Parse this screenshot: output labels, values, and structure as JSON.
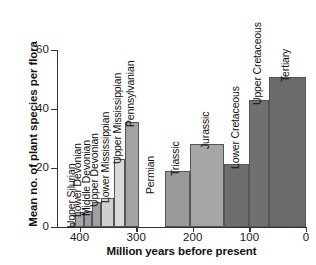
{
  "chart_data": {
    "type": "bar",
    "title": "",
    "xlabel": "Million years before present",
    "ylabel": "Mean no. of plant species per flora",
    "xlim": [
      440,
      0
    ],
    "ylim": [
      0,
      60
    ],
    "x_ticks": [
      400,
      300,
      200,
      100,
      0
    ],
    "x_tick_labels": [
      "400",
      "300",
      "200",
      "100",
      "0"
    ],
    "y_ticks": [
      0,
      20,
      40,
      60
    ],
    "y_tick_labels": [
      "0",
      "20",
      "40",
      "60"
    ],
    "grid": false,
    "legend": "none",
    "axis_direction": "x-axis reversed: older (400 Ma) on left, present (0) on right",
    "categories": [
      "Upper Silurian",
      "Lower Devonian",
      "Middle Devonian",
      "Upper Devonian",
      "Lower Mississippian",
      "Upper Mississippian",
      "Pennsylvanian",
      "Permian",
      "Triassic",
      "Jurassic",
      "Lower Cretaceous",
      "Upper Cretaceous",
      "Tertiary"
    ],
    "values": [
      1.5,
      5,
      5.5,
      8.5,
      10,
      23,
      35.5,
      null,
      19,
      28,
      21.5,
      43,
      51
    ],
    "bars": [
      {
        "label": "Upper Silurian",
        "value": 1.5,
        "x_start": 417,
        "x_end": 408,
        "color": "#aaaaaa"
      },
      {
        "label": "Lower Devonian",
        "value": 5.0,
        "x_start": 408,
        "x_end": 393,
        "color": "#a8a8a8"
      },
      {
        "label": "Middle Devonian",
        "value": 5.5,
        "x_start": 393,
        "x_end": 379,
        "color": "#9c9c9c"
      },
      {
        "label": "Upper Devonian",
        "value": 8.5,
        "x_start": 379,
        "x_end": 362,
        "color": "#a0a0a0"
      },
      {
        "label": "Lower Mississippian",
        "value": 10.0,
        "x_start": 362,
        "x_end": 340,
        "color": "#cfcfcf"
      },
      {
        "label": "Upper Mississippian",
        "value": 23.0,
        "x_start": 340,
        "x_end": 320,
        "color": "#d9d9d9"
      },
      {
        "label": "Pennsylvanian",
        "value": 35.5,
        "x_start": 320,
        "x_end": 295,
        "color": "#a3a3a3"
      },
      {
        "label": "Permian",
        "value": null,
        "x_start": 295,
        "x_end": 250,
        "color": "none"
      },
      {
        "label": "Triassic",
        "value": 19.0,
        "x_start": 250,
        "x_end": 205,
        "color": "#9a9a9a"
      },
      {
        "label": "Jurassic",
        "value": 28.0,
        "x_start": 205,
        "x_end": 145,
        "color": "#a6a6a6"
      },
      {
        "label": "Lower Cretaceous",
        "value": 21.5,
        "x_start": 145,
        "x_end": 100,
        "color": "#6e6e6e"
      },
      {
        "label": "Upper Cretaceous",
        "value": 43.0,
        "x_start": 100,
        "x_end": 66,
        "color": "#707070"
      },
      {
        "label": "Tertiary",
        "value": 51.0,
        "x_start": 66,
        "x_end": 0,
        "color": "#6b6b6b"
      }
    ]
  },
  "colors": {
    "axis": "#333333",
    "text": "#111111",
    "background": "#ffffff",
    "bar_light": "#d9d9d9",
    "bar_mid": "#a3a3a3",
    "bar_dark": "#6e6e6e"
  }
}
